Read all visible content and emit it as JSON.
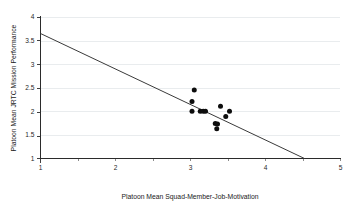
{
  "chart_data": {
    "type": "scatter",
    "title": "",
    "xlabel": "Platoon Mean Squad-Member-Job-Motivation",
    "ylabel": "Platoon Mean JRTC Mission Performance",
    "xlim": [
      1,
      5
    ],
    "ylim": [
      1,
      4
    ],
    "xticks": [
      1,
      2,
      3,
      4,
      5
    ],
    "yticks": [
      1,
      1.5,
      2,
      2.5,
      3,
      3.5,
      4
    ],
    "xtick_labels": [
      "1",
      "2",
      "3",
      "4",
      "5"
    ],
    "ytick_labels": [
      "1",
      "1.5",
      "2",
      "2.5",
      "3",
      "3.5",
      "4"
    ],
    "grid": true,
    "grid_axis": "y",
    "legend": false,
    "legend_position": "none",
    "marker": "filled-circle",
    "marker_color": "#0d0d0d",
    "line_color": "#3a3a3a",
    "points": [
      {
        "x": 3.05,
        "y": 2.45
      },
      {
        "x": 3.02,
        "y": 2.21
      },
      {
        "x": 3.02,
        "y": 2.0
      },
      {
        "x": 3.13,
        "y": 2.0
      },
      {
        "x": 3.17,
        "y": 2.0
      },
      {
        "x": 3.2,
        "y": 2.0
      },
      {
        "x": 3.4,
        "y": 2.11
      },
      {
        "x": 3.52,
        "y": 2.0
      },
      {
        "x": 3.47,
        "y": 1.89
      },
      {
        "x": 3.33,
        "y": 1.74
      },
      {
        "x": 3.36,
        "y": 1.73
      },
      {
        "x": 3.35,
        "y": 1.63
      }
    ],
    "trend_line": {
      "x_start": 1.0,
      "y_start": 3.65,
      "x_end": 4.52,
      "y_end": 1.0,
      "slope": -0.753,
      "intercept": 4.403
    }
  }
}
